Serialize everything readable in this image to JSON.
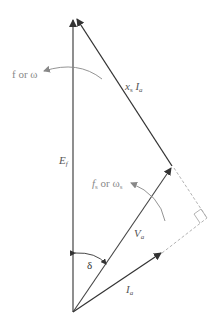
{
  "diagram": {
    "type": "phasor-diagram",
    "colors": {
      "phasor": "#333333",
      "annotation": "#777777",
      "dashed": "#aaaaaa"
    },
    "phasors": [
      {
        "id": "Ef",
        "label": "E",
        "subscript": "f"
      },
      {
        "id": "Va",
        "label": "V",
        "subscript": "a"
      },
      {
        "id": "Ia",
        "label": "I",
        "subscript": "a"
      },
      {
        "id": "xsIa",
        "label_x": "x",
        "label_x_sub": "s",
        "label_i": "I",
        "label_i_sub": "a"
      }
    ],
    "angle": {
      "label": "δ"
    },
    "rotation_rotor": {
      "label": "f or ω"
    },
    "rotation_stator": {
      "label_f": "f",
      "label_f_sub": "s",
      "label_or": " or ω",
      "label_w_sub": "s"
    }
  }
}
